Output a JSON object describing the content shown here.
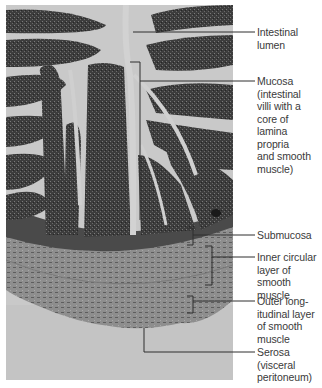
{
  "figure": {
    "type": "histology-micrograph",
    "colors": {
      "background": "#ffffff",
      "lumen": "#c9c9c9",
      "villus_dark": "#3c3c3c",
      "muscle": "#8f8f8f",
      "serosa_bg": "#c4c4c4",
      "leader_line": "#2e2e2e",
      "label_text": "#3a3a3a"
    },
    "labels": [
      {
        "id": "intestinal-lumen",
        "text": "Intestinal\nlumen"
      },
      {
        "id": "mucosa",
        "text": "Mucosa\n(intestinal\nvilli with a\ncore of\nlamina propria\nand smooth\nmuscle)"
      },
      {
        "id": "submucosa",
        "text": "Submucosa"
      },
      {
        "id": "inner-circular",
        "text": "Inner circular\nlayer of\nsmooth muscle"
      },
      {
        "id": "outer-longitudinal",
        "text": "Outer long-\nitudinal layer\nof smooth\nmuscle"
      },
      {
        "id": "serosa",
        "text": "Serosa\n(visceral\nperitoneum)"
      }
    ]
  }
}
